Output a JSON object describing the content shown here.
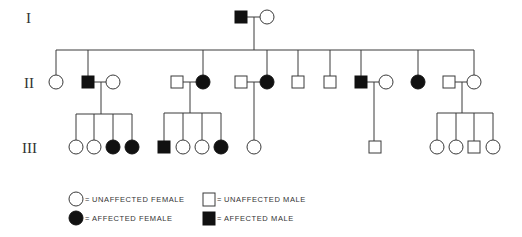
{
  "diagram": {
    "type": "pedigree",
    "generation_labels": [
      "I",
      "II",
      "III"
    ],
    "colors": {
      "affected": "#111111",
      "unaffected": "#ffffff",
      "line": "#3a3a3a"
    },
    "generations": [
      {
        "label": "I",
        "individuals": [
          {
            "id": "I-1",
            "sex": "male",
            "affected": true,
            "x": 241
          },
          {
            "id": "I-2",
            "sex": "female",
            "affected": false,
            "x": 267
          }
        ]
      },
      {
        "label": "II",
        "individuals": [
          {
            "id": "II-1",
            "sex": "female",
            "affected": false,
            "x": 56
          },
          {
            "id": "II-2",
            "sex": "male",
            "affected": true,
            "x": 88
          },
          {
            "id": "II-2s",
            "sex": "female",
            "affected": false,
            "x": 113,
            "spouse": true
          },
          {
            "id": "II-3s",
            "sex": "male",
            "affected": false,
            "x": 177,
            "spouse": true
          },
          {
            "id": "II-3",
            "sex": "female",
            "affected": true,
            "x": 203
          },
          {
            "id": "II-4s",
            "sex": "male",
            "affected": false,
            "x": 241,
            "spouse": true
          },
          {
            "id": "II-4",
            "sex": "female",
            "affected": true,
            "x": 267
          },
          {
            "id": "II-5",
            "sex": "male",
            "affected": false,
            "x": 298
          },
          {
            "id": "II-6",
            "sex": "male",
            "affected": false,
            "x": 330
          },
          {
            "id": "II-7",
            "sex": "male",
            "affected": true,
            "x": 361
          },
          {
            "id": "II-7s",
            "sex": "female",
            "affected": false,
            "x": 386,
            "spouse": true
          },
          {
            "id": "II-8",
            "sex": "female",
            "affected": true,
            "x": 418
          },
          {
            "id": "II-9s",
            "sex": "male",
            "affected": false,
            "x": 449,
            "spouse": true
          },
          {
            "id": "II-9",
            "sex": "female",
            "affected": false,
            "x": 474
          }
        ]
      },
      {
        "label": "III",
        "individuals": [
          {
            "id": "III-1",
            "sex": "female",
            "affected": false,
            "x": 76
          },
          {
            "id": "III-2",
            "sex": "female",
            "affected": false,
            "x": 94
          },
          {
            "id": "III-3",
            "sex": "female",
            "affected": true,
            "x": 113
          },
          {
            "id": "III-4",
            "sex": "female",
            "affected": true,
            "x": 132
          },
          {
            "id": "III-5",
            "sex": "male",
            "affected": true,
            "x": 164
          },
          {
            "id": "III-6",
            "sex": "female",
            "affected": false,
            "x": 183
          },
          {
            "id": "III-7",
            "sex": "female",
            "affected": false,
            "x": 202
          },
          {
            "id": "III-8",
            "sex": "female",
            "affected": true,
            "x": 221
          },
          {
            "id": "III-9",
            "sex": "female",
            "affected": false,
            "x": 254
          },
          {
            "id": "III-10",
            "sex": "male",
            "affected": false,
            "x": 375
          },
          {
            "id": "III-11",
            "sex": "female",
            "affected": false,
            "x": 437
          },
          {
            "id": "III-12",
            "sex": "female",
            "affected": false,
            "x": 456
          },
          {
            "id": "III-13",
            "sex": "male",
            "affected": false,
            "x": 474
          },
          {
            "id": "III-14",
            "sex": "female",
            "affected": false,
            "x": 493
          }
        ]
      }
    ]
  },
  "legend": {
    "items": [
      {
        "symbol": "open-circle",
        "separator": "=",
        "label": "UNAFFECTED FEMALE"
      },
      {
        "symbol": "open-square",
        "separator": "=",
        "label": "UNAFFECTED MALE"
      },
      {
        "symbol": "filled-circle",
        "separator": "=",
        "label": "AFFECTED FEMALE"
      },
      {
        "symbol": "filled-square",
        "separator": "=",
        "label": "AFFECTED MALE"
      }
    ]
  }
}
